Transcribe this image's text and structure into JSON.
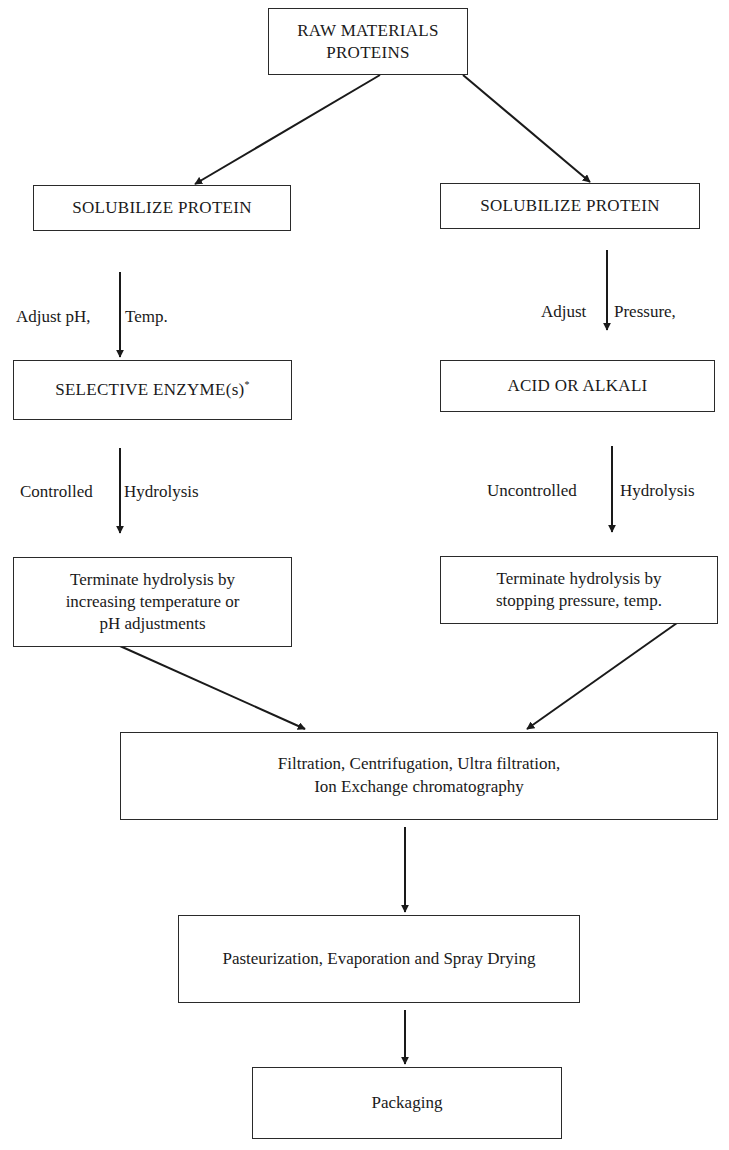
{
  "diagram": {
    "type": "flowchart",
    "nodes": {
      "raw_materials": {
        "line1": "RAW MATERIALS",
        "line2": "PROTEINS"
      },
      "left_solubilize": {
        "label": "SOLUBILIZE PROTEIN"
      },
      "right_solubilize": {
        "label": "SOLUBILIZE PROTEIN"
      },
      "selective_enzyme": {
        "label": "SELECTIVE ENZYME(s)",
        "superscript": "*"
      },
      "acid_alkali": {
        "label": "ACID OR ALKALI"
      },
      "left_terminate": {
        "line1": "Terminate hydrolysis by",
        "line2": "increasing temperature or",
        "line3": "pH adjustments"
      },
      "right_terminate": {
        "line1": "Terminate hydrolysis by",
        "line2": "stopping pressure, temp."
      },
      "filtration": {
        "line1": "Filtration, Centrifugation, Ultra filtration,",
        "line2": "Ion Exchange chromatography"
      },
      "pasteurization": {
        "label": "Pasteurization, Evaporation and Spray Drying"
      },
      "packaging": {
        "label": "Packaging"
      }
    },
    "edge_labels": {
      "left_adjust": {
        "before": "Adjust pH,",
        "after": "Temp."
      },
      "right_adjust": {
        "before": "Adjust",
        "after": "Pressure,"
      },
      "left_hydrolysis": {
        "before": "Controlled",
        "after": "Hydrolysis"
      },
      "right_hydrolysis": {
        "before": "Uncontrolled",
        "after": "Hydrolysis"
      }
    },
    "edges": [
      [
        "raw_materials",
        "left_solubilize"
      ],
      [
        "raw_materials",
        "right_solubilize"
      ],
      [
        "left_solubilize",
        "selective_enzyme"
      ],
      [
        "right_solubilize",
        "acid_alkali"
      ],
      [
        "selective_enzyme",
        "left_terminate"
      ],
      [
        "acid_alkali",
        "right_terminate"
      ],
      [
        "left_terminate",
        "filtration"
      ],
      [
        "right_terminate",
        "filtration"
      ],
      [
        "filtration",
        "pasteurization"
      ],
      [
        "pasteurization",
        "packaging"
      ]
    ],
    "colors": {
      "line": "#1a1a1a",
      "background": "#ffffff"
    }
  }
}
